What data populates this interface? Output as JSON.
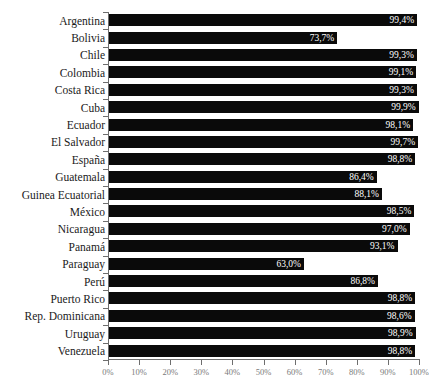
{
  "chart": {
    "title_remnant": "",
    "axis_color": "#6e6e6e",
    "bar_color": "#0a0a0a",
    "value_label_color": "#ffffff",
    "tick_label_color": "#7a7a7a"
  },
  "chart_data": {
    "type": "bar",
    "orientation": "horizontal",
    "title": "",
    "xlabel": "",
    "ylabel": "",
    "xlim": [
      0,
      100
    ],
    "grid": false,
    "legend": null,
    "value_suffix": "%",
    "decimal_separator": ",",
    "categories": [
      "Argentina",
      "Bolivia",
      "Chile",
      "Colombia",
      "Costa Rica",
      "Cuba",
      "Ecuador",
      "El Salvador",
      "España",
      "Guatemala",
      "Guinea Ecuatorial",
      "México",
      "Nicaragua",
      "Panamá",
      "Paraguay",
      "Perú",
      "Puerto Rico",
      "Rep. Dominicana",
      "Uruguay",
      "Venezuela"
    ],
    "values": [
      99.4,
      73.7,
      99.3,
      99.1,
      99.3,
      99.9,
      98.1,
      99.7,
      98.8,
      86.4,
      88.1,
      98.5,
      97.0,
      93.1,
      63.0,
      86.8,
      98.8,
      98.6,
      98.9,
      98.8
    ],
    "data_labels": [
      "99,4%",
      "73,7%",
      "99,3%",
      "99,1%",
      "99,3%",
      "99,9%",
      "98,1%",
      "99,7%",
      "98,8%",
      "86,4%",
      "88,1%",
      "98,5%",
      "97,0%",
      "93,1%",
      "63,0%",
      "86,8%",
      "98,8%",
      "98,6%",
      "98,9%",
      "98,8%"
    ],
    "xticks": [
      0,
      10,
      20,
      30,
      40,
      50,
      60,
      70,
      80,
      90,
      100
    ],
    "xtick_labels": [
      "0%",
      "10%",
      "20%",
      "30%",
      "40%",
      "50%",
      "60%",
      "70%",
      "80%",
      "90%",
      "100%"
    ]
  }
}
